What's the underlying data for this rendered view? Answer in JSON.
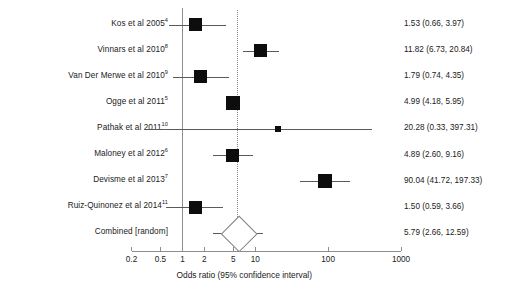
{
  "chart_data": {
    "type": "forest",
    "title": "",
    "xlabel": "Odds ratio (95% confidence interval)",
    "ylabel": "",
    "xscale": "log",
    "xlim": [
      0.2,
      1000
    ],
    "xticks": [
      0.2,
      0.5,
      1,
      2,
      5,
      10,
      100,
      1000
    ],
    "xtick_labels": [
      "0.2",
      "0.5",
      "1",
      "2",
      "5",
      "10",
      "100",
      "1000"
    ],
    "null_line": 1,
    "pooled_line": 5.79,
    "grid": false,
    "legend": null,
    "effect_measure": "Odds ratio",
    "model": "random effects",
    "studies": [
      {
        "label": "Kos et al 2005",
        "superscript": "4",
        "estimate": 1.53,
        "ci_low": 0.66,
        "ci_high": 3.97,
        "value_text": "1.53 (0.66, 3.97)",
        "weight_box": 13
      },
      {
        "label": "Vinnars et al 2010",
        "superscript": "8",
        "estimate": 11.82,
        "ci_low": 6.73,
        "ci_high": 20.84,
        "value_text": "11.82 (6.73, 20.84)",
        "weight_box": 13
      },
      {
        "label": "Van Der Merwe et al 2010",
        "superscript": "9",
        "estimate": 1.79,
        "ci_low": 0.74,
        "ci_high": 4.35,
        "value_text": "1.79 (0.74, 4.35)",
        "weight_box": 13
      },
      {
        "label": "Ogge et al 2011",
        "superscript": "5",
        "estimate": 4.99,
        "ci_low": 4.18,
        "ci_high": 5.95,
        "value_text": "4.99 (4.18, 5.95)",
        "weight_box": 14
      },
      {
        "label": "Pathak et al 2011",
        "superscript": "10",
        "estimate": 20.28,
        "ci_low": 0.33,
        "ci_high": 397.31,
        "value_text": "20.28 (0.33, 397.31)",
        "weight_box": 6
      },
      {
        "label": "Maloney et al 2012",
        "superscript": "6",
        "estimate": 4.89,
        "ci_low": 2.6,
        "ci_high": 9.16,
        "value_text": "4.89 (2.60, 9.16)",
        "weight_box": 13
      },
      {
        "label": "Devisme et al 2013",
        "superscript": "7",
        "estimate": 90.04,
        "ci_low": 41.72,
        "ci_high": 197.33,
        "value_text": "90.04 (41.72, 197.33)",
        "weight_box": 14
      },
      {
        "label": "Ruiz-Quinonez et al 2014",
        "superscript": "11",
        "estimate": 1.5,
        "ci_low": 0.59,
        "ci_high": 3.66,
        "value_text": "1.50 (0.59, 3.66)",
        "weight_box": 13
      }
    ],
    "summary": {
      "label": "Combined [random]",
      "superscript": "",
      "estimate": 5.79,
      "ci_low": 2.66,
      "ci_high": 12.59,
      "value_text": "5.79 (2.66, 12.59)"
    },
    "colors": {
      "box": "#0d0d0d",
      "line": "#5a5a5a",
      "axis": "#8d8d8d",
      "text": "#1a1a1a",
      "diamond_fill": "#ffffff",
      "diamond_stroke": "#7d7d7d"
    }
  }
}
